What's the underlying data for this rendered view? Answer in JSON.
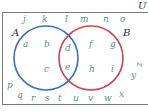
{
  "diagram": {
    "type": "venn",
    "universal_label": "U",
    "sets": [
      {
        "name": "A",
        "color": "#3a6fc7"
      },
      {
        "name": "B",
        "color": "#d0414f"
      }
    ],
    "regions": {
      "A_only": [
        "a",
        "b",
        "c"
      ],
      "A_and_B": [
        "d",
        "e"
      ],
      "B_only": [
        "f",
        "g",
        "h",
        "i"
      ],
      "outside": [
        "j",
        "k",
        "l",
        "m",
        "n",
        "o",
        "p",
        "q",
        "r",
        "s",
        "t",
        "u",
        "v",
        "w",
        "x",
        "y",
        "z"
      ]
    },
    "colors": {
      "element_text": "#5a8f8a",
      "label_text": "#2b2b2b",
      "border": "#7a7a7a"
    }
  },
  "labels": {
    "U": "U",
    "A": "A",
    "B": "B"
  },
  "elements": {
    "a": "a",
    "b": "b",
    "c": "c",
    "d": "d",
    "e": "e",
    "f": "f",
    "g": "g",
    "h": "h",
    "i": "i",
    "j": "j",
    "k": "k",
    "l": "l",
    "m": "m",
    "n": "n",
    "o": "o",
    "p": "p",
    "q": "q",
    "r": "r",
    "s": "s",
    "t": "t",
    "u": "u",
    "v": "v",
    "w": "w",
    "x": "x",
    "y": "y",
    "z": "z"
  }
}
